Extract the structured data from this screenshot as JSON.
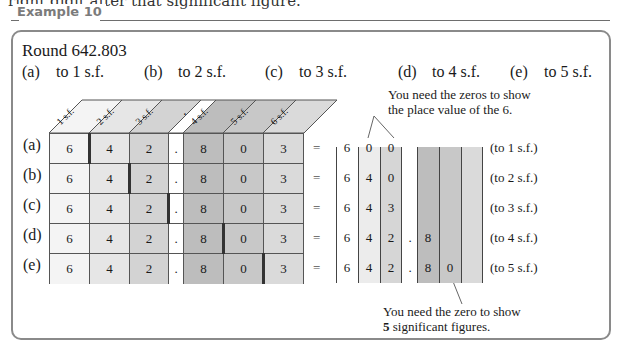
{
  "cutoff_text": "right digit after that significant figure.",
  "example": {
    "title": "Example 10",
    "question": "Round 642.803",
    "parts": [
      {
        "label": "(a)",
        "text": "to 1 s.f."
      },
      {
        "label": "(b)",
        "text": "to 2 s.f."
      },
      {
        "label": "(c)",
        "text": "to 3 s.f."
      },
      {
        "label": "(d)",
        "text": "to 4 s.f."
      },
      {
        "label": "(e)",
        "text": "to 5 s.f."
      }
    ]
  },
  "grid": {
    "headers": [
      "1 s.f.",
      "2 s.f.",
      "3 s.f.",
      ".",
      "4 s.f.",
      "5 s.f.",
      "6 s.f."
    ],
    "digits": [
      "6",
      "4",
      "2",
      ".",
      "8",
      "0",
      "3"
    ],
    "column_colors": [
      "#f4f4f4",
      "#e6e6e6",
      "#d3d3d3",
      "#ffffff",
      "#bdbdbd",
      "#c8c8c8",
      "#dadada"
    ],
    "rows": [
      {
        "label": "(a)",
        "cut_after": 1,
        "equals": "=",
        "result": [
          "6",
          "0",
          "0",
          "",
          "",
          "",
          ""
        ],
        "note": "(to 1 s.f.)"
      },
      {
        "label": "(b)",
        "cut_after": 2,
        "equals": "=",
        "result": [
          "6",
          "4",
          "0",
          "",
          "",
          "",
          ""
        ],
        "note": "(to 2 s.f.)"
      },
      {
        "label": "(c)",
        "cut_after": 3,
        "equals": "=",
        "result": [
          "6",
          "4",
          "3",
          "",
          "",
          "",
          ""
        ],
        "note": "(to 3 s.f.)"
      },
      {
        "label": "(d)",
        "cut_after": 5,
        "equals": "=",
        "result": [
          "6",
          "4",
          "2",
          ".",
          "8",
          "",
          ""
        ],
        "note": "(to 4 s.f.)"
      },
      {
        "label": "(e)",
        "cut_after": 6,
        "equals": "=",
        "result": [
          "6",
          "4",
          "2",
          ".",
          "8",
          "0",
          ""
        ],
        "note": "(to 5 s.f.)"
      }
    ]
  },
  "annotations": {
    "top": [
      "You need the zeros to show",
      "the place value of the 6."
    ],
    "bottom_line1": "You need the zero to show",
    "bottom_bold": "5",
    "bottom_line2_rest": " significant figures."
  }
}
